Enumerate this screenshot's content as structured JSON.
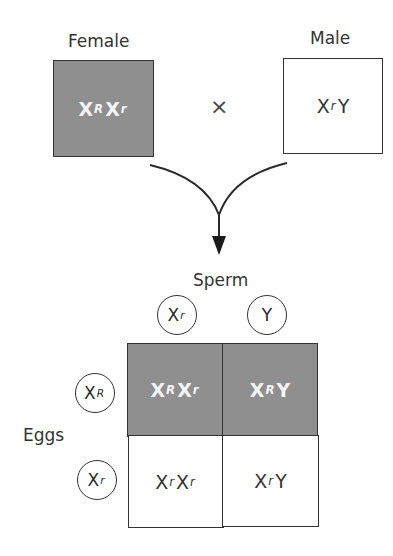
{
  "parents": {
    "female": {
      "label": "Female",
      "genotype_base1": "X",
      "allele1": "R",
      "genotype_base2": "X",
      "allele2": "r",
      "shaded": true
    },
    "cross_symbol": "×",
    "male": {
      "label": "Male",
      "genotype_base1": "X",
      "allele1": "r",
      "genotype_base2": "Y",
      "allele2": "",
      "shaded": false
    }
  },
  "punnett": {
    "sperm_label": "Sperm",
    "eggs_label": "Eggs",
    "sperm_gametes": [
      {
        "base": "X",
        "allele": "r"
      },
      {
        "base": "Y",
        "allele": ""
      }
    ],
    "egg_gametes": [
      {
        "base": "X",
        "allele": "R"
      },
      {
        "base": "X",
        "allele": "r"
      }
    ],
    "cells": [
      {
        "b1": "X",
        "a1": "R",
        "b2": "X",
        "a2": "r",
        "shaded": true
      },
      {
        "b1": "X",
        "a1": "R",
        "b2": "Y",
        "a2": "",
        "shaded": true
      },
      {
        "b1": "X",
        "a1": "r",
        "b2": "X",
        "a2": "r",
        "shaded": false
      },
      {
        "b1": "X",
        "a1": "r",
        "b2": "Y",
        "a2": "",
        "shaded": false
      }
    ]
  },
  "colors": {
    "shaded_fill": "#8f8f8f",
    "line": "#333333"
  }
}
